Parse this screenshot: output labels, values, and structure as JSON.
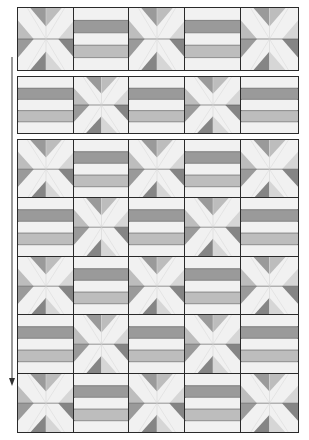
{
  "diagram": {
    "type": "quilt-layout",
    "columns": 5,
    "col_edges": [
      18,
      74,
      129,
      185,
      241,
      298
    ],
    "sections": [
      {
        "id": "row-unit-1",
        "top": 8,
        "rows": 1,
        "row_height": 62,
        "start": "x"
      },
      {
        "id": "row-unit-2",
        "top": 77,
        "rows": 1,
        "row_height": 56,
        "start": "stripe"
      },
      {
        "id": "assembled-quilt",
        "top": 140,
        "rows": 5,
        "row_height": 58.4,
        "start": "x"
      }
    ],
    "blocks": {
      "x": {
        "name": "x-block",
        "description": "Cross / X block with shaded corner triangles"
      },
      "stripe": {
        "name": "stripe-block",
        "description": "Five horizontal bands"
      }
    },
    "arrow": {
      "x": 12,
      "y1": 57,
      "y2": 386,
      "direction": "down",
      "label": "sew rows together"
    }
  },
  "colors": {
    "background": "#ffffff",
    "outline": "#2a2a2a",
    "seam": "#555555",
    "light": "#f1f1f1",
    "pale": "#d6d6d6",
    "medium": "#bdbdbd",
    "dark": "#9a9a9a",
    "darker": "#858585"
  }
}
